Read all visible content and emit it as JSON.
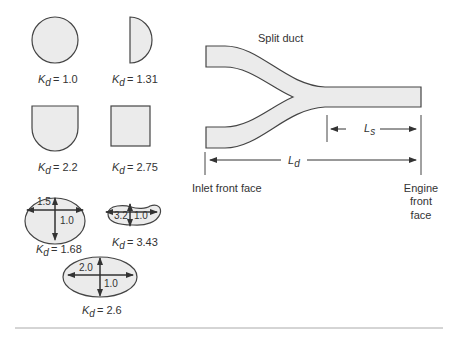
{
  "colors": {
    "shape_fill": "#ebebeb",
    "stroke": "#444444",
    "text": "#333333",
    "rule": "#999999"
  },
  "shapes": [
    {
      "name": "circle",
      "kd_label": "K",
      "kd_sub": "d",
      "kd_value": "= 1.0"
    },
    {
      "name": "half-circle",
      "kd_label": "K",
      "kd_sub": "d",
      "kd_value": "= 1.31"
    },
    {
      "name": "d-shape",
      "kd_label": "K",
      "kd_sub": "d",
      "kd_value": "= 2.2"
    },
    {
      "name": "square",
      "kd_label": "K",
      "kd_sub": "d",
      "kd_value": "= 2.75"
    },
    {
      "name": "ellipse-1.5",
      "kd_label": "K",
      "kd_sub": "d",
      "kd_value": "= 1.68",
      "dim_major": "1.5",
      "dim_minor": "1.0"
    },
    {
      "name": "kidney",
      "kd_label": "K",
      "kd_sub": "d",
      "kd_value": "= 3.43",
      "dim_major": "3.2",
      "dim_minor": "1.0"
    },
    {
      "name": "ellipse-2.0",
      "kd_label": "K",
      "kd_sub": "d",
      "kd_value": "= 2.6",
      "dim_major": "2.0",
      "dim_minor": "1.0"
    }
  ],
  "duct": {
    "title": "Split duct",
    "ls_label": "L",
    "ls_sub": "s",
    "ld_label": "L",
    "ld_sub": "d",
    "inlet_label": "Inlet front face",
    "engine_label_lines": [
      "Engine",
      "front",
      "face"
    ]
  }
}
